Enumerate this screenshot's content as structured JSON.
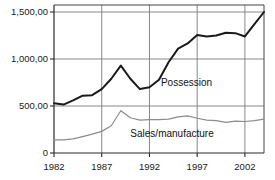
{
  "chart_data": {
    "type": "line",
    "title": "",
    "xlabel": "",
    "ylabel": "",
    "xlim": [
      1982,
      2004
    ],
    "ylim": [
      0,
      1550
    ],
    "grid": true,
    "legend_position": "inline-annotation",
    "xtick_labels": [
      "1982",
      "1987",
      "1992",
      "1997",
      "2002"
    ],
    "xtick_values": [
      1982,
      1987,
      1992,
      1997,
      2002
    ],
    "ytick_labels": [
      "1,500,00",
      "1,000,00",
      "500,00",
      "0"
    ],
    "ytick_values": [
      1500,
      1000,
      500,
      0
    ],
    "x": [
      1982,
      1983,
      1984,
      1985,
      1986,
      1987,
      1988,
      1989,
      1990,
      1991,
      1992,
      1993,
      1994,
      1995,
      1996,
      1997,
      1998,
      1999,
      2000,
      2001,
      2002,
      2003,
      2004
    ],
    "series": [
      {
        "name": "Possession",
        "color": "#1a1a1a",
        "width": 2.0,
        "values": [
          530,
          515,
          560,
          610,
          615,
          680,
          790,
          930,
          790,
          680,
          700,
          780,
          965,
          1110,
          1165,
          1255,
          1240,
          1250,
          1280,
          1275,
          1240,
          1370,
          1500
        ],
        "label_x": 1993.2,
        "label_y": 745
      },
      {
        "name": "Sales/manufacture",
        "color": "#8c8c8c",
        "width": 1.2,
        "values": [
          140,
          140,
          150,
          175,
          200,
          230,
          290,
          450,
          375,
          350,
          355,
          355,
          360,
          385,
          395,
          370,
          350,
          345,
          325,
          340,
          335,
          345,
          360
        ],
        "label_x": 1990.0,
        "label_y": 200
      }
    ]
  },
  "axes": {
    "plot_left_px": 54,
    "plot_right_px": 264,
    "plot_top_px": 5,
    "plot_bottom_px": 153
  }
}
